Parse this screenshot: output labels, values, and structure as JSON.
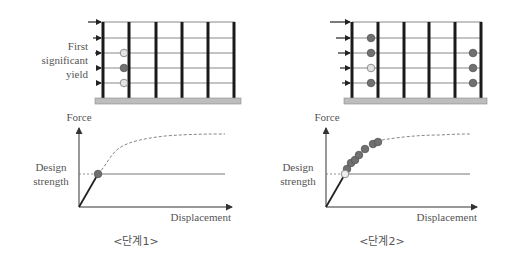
{
  "colors": {
    "column": "#1a1a1a",
    "beam": "#888888",
    "base": "#bdbdbd",
    "base_stroke": "#8a8a8a",
    "hinge_yield": "#707070",
    "hinge_first": "#e3e3e3",
    "axis": "#333333",
    "design_line": "#777777",
    "curve_dashed": "#777777",
    "elastic": "#222222",
    "text": "#555555"
  },
  "stage1": {
    "label": "First significant yield",
    "label_lines": [
      "First",
      "significant",
      "yield"
    ],
    "frame": {
      "stories": 5,
      "bays": 5,
      "load_arrows": [
        "story-1",
        "story-2",
        "story-3",
        "story-4",
        "story-5"
      ],
      "hinges": [
        {
          "bay_column": 1,
          "story_level": 3,
          "state": "first-yield"
        },
        {
          "bay_column": 1,
          "story_level": 4,
          "state": "yielded"
        },
        {
          "bay_column": 1,
          "story_level": 5,
          "state": "first-yield"
        }
      ]
    },
    "chart": {
      "y_axis_label": "Force",
      "x_axis_label": "Displacement",
      "design_label_lines": [
        "Design",
        "strength"
      ],
      "design_strength_label": "Design strength",
      "hinge_states": [
        "yielded"
      ]
    },
    "caption": "<단계1>"
  },
  "stage2": {
    "frame": {
      "stories": 5,
      "bays": 5,
      "load_arrows": [
        "story-1",
        "story-2",
        "story-3",
        "story-4",
        "story-5"
      ],
      "hinges": [
        {
          "bay_column": 1,
          "story_level": 2,
          "state": "yielded"
        },
        {
          "bay_column": 1,
          "story_level": 3,
          "state": "yielded"
        },
        {
          "bay_column": 1,
          "story_level": 4,
          "state": "first-yield"
        },
        {
          "bay_column": 1,
          "story_level": 5,
          "state": "yielded"
        },
        {
          "bay_column": 5,
          "story_level": 3,
          "state": "yielded"
        },
        {
          "bay_column": 5,
          "story_level": 4,
          "state": "yielded"
        },
        {
          "bay_column": 5,
          "story_level": 5,
          "state": "yielded"
        }
      ]
    },
    "chart": {
      "y_axis_label": "Force",
      "x_axis_label": "Displacement",
      "design_label_lines": [
        "Design",
        "strength"
      ],
      "design_strength_label": "Design strength",
      "hinge_states": [
        "first-yield",
        "yielded",
        "yielded",
        "yielded",
        "yielded",
        "yielded",
        "yielded",
        "yielded"
      ]
    },
    "caption": "<단계2>"
  }
}
